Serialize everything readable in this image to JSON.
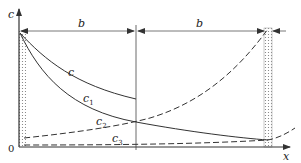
{
  "figure": {
    "y_axis_label": "c",
    "x_axis_label": "x",
    "origin_label": "0",
    "dimension_labels": [
      "b",
      "b"
    ],
    "curves": [
      {
        "name": "c",
        "label": "c",
        "subscript": "",
        "style": "solid"
      },
      {
        "name": "c1",
        "label": "c",
        "subscript": "1",
        "style": "solid"
      },
      {
        "name": "c2",
        "label": "c",
        "subscript": "2",
        "style": "dashed"
      },
      {
        "name": "c3",
        "label": "c",
        "subscript": "3",
        "style": "dashed"
      }
    ],
    "colors": {
      "line": "#333333",
      "hatch": "#888888",
      "background": "#ffffff"
    }
  }
}
